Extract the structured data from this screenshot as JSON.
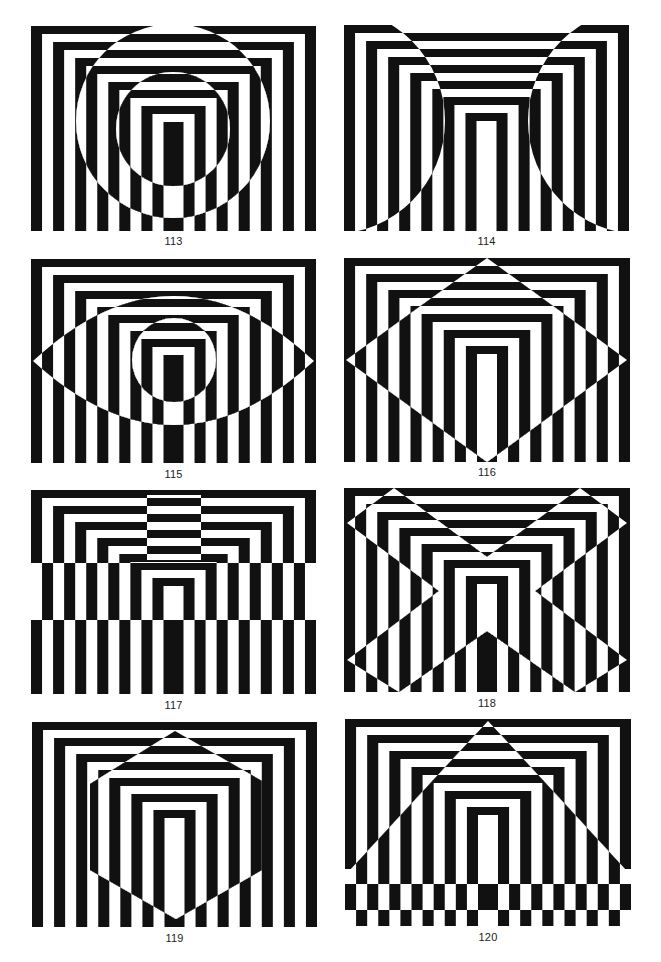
{
  "page": {
    "background": "#ffffff",
    "ink": "#111111"
  },
  "pattern": {
    "rings": 12,
    "center_bar_width": 20,
    "band_height": 8
  },
  "figures": [
    {
      "id": "113",
      "caption": "113",
      "x": 31,
      "y": 26,
      "w": 285,
      "h": 205,
      "caption_y": 235,
      "overlays": [
        {
          "type": "circle",
          "cx": 142,
          "cy": 95,
          "r": 97
        },
        {
          "type": "circle",
          "cx": 142,
          "cy": 103,
          "r": 57
        }
      ]
    },
    {
      "id": "114",
      "caption": "114",
      "x": 344,
      "y": 25,
      "w": 285,
      "h": 206,
      "caption_y": 235,
      "overlays": [
        {
          "type": "circle",
          "cx": -12,
          "cy": 96,
          "r": 113
        },
        {
          "type": "circle",
          "cx": 297,
          "cy": 96,
          "r": 113
        },
        {
          "type": "rect",
          "x": 0,
          "y": 0,
          "w": 285,
          "h": 206
        }
      ]
    },
    {
      "id": "115",
      "caption": "115",
      "x": 31,
      "y": 259,
      "w": 285,
      "h": 204,
      "caption_y": 468,
      "overlays": [
        {
          "type": "path",
          "d": "M2,102 Q143,-28 283,102 Q143,230 2,102 Z"
        },
        {
          "type": "circle",
          "cx": 143,
          "cy": 101,
          "r": 42
        }
      ]
    },
    {
      "id": "116",
      "caption": "116",
      "x": 344,
      "y": 258,
      "w": 286,
      "h": 204,
      "caption_y": 466,
      "overlays": [
        {
          "type": "polygon",
          "points": "143,0 283,102 143,204 2,102"
        }
      ]
    },
    {
      "id": "117",
      "caption": "117",
      "x": 31,
      "y": 490,
      "w": 285,
      "h": 204,
      "caption_y": 699,
      "overlays": [
        {
          "type": "rect",
          "x": 116,
          "y": 5,
          "w": 54,
          "h": 65
        },
        {
          "type": "rect",
          "x": 0,
          "y": 73,
          "w": 285,
          "h": 57
        }
      ]
    },
    {
      "id": "118",
      "caption": "118",
      "x": 344,
      "y": 488,
      "w": 286,
      "h": 204,
      "caption_y": 697,
      "overlays": [
        {
          "type": "polygon",
          "points": "50,0 143,69 236,0 283,35 191,103 283,172 231,204 143,143 55,204 3,172 95,103 3,35"
        }
      ]
    },
    {
      "id": "119",
      "caption": "119",
      "x": 32,
      "y": 722,
      "w": 285,
      "h": 205,
      "caption_y": 932,
      "overlays": [
        {
          "type": "polygon",
          "points": "143,9 230,59 230,148 144,197 58,148 58,62"
        }
      ]
    },
    {
      "id": "120",
      "caption": "120",
      "x": 345,
      "y": 719,
      "w": 286,
      "h": 207,
      "caption_y": 931,
      "overlays": [
        {
          "type": "polygon",
          "points": "143,2 282,152 4,152"
        },
        {
          "type": "rect",
          "x": 0,
          "y": 150,
          "w": 286,
          "h": 15
        },
        {
          "type": "rect",
          "x": 0,
          "y": 191,
          "w": 286,
          "h": 16
        }
      ]
    }
  ]
}
